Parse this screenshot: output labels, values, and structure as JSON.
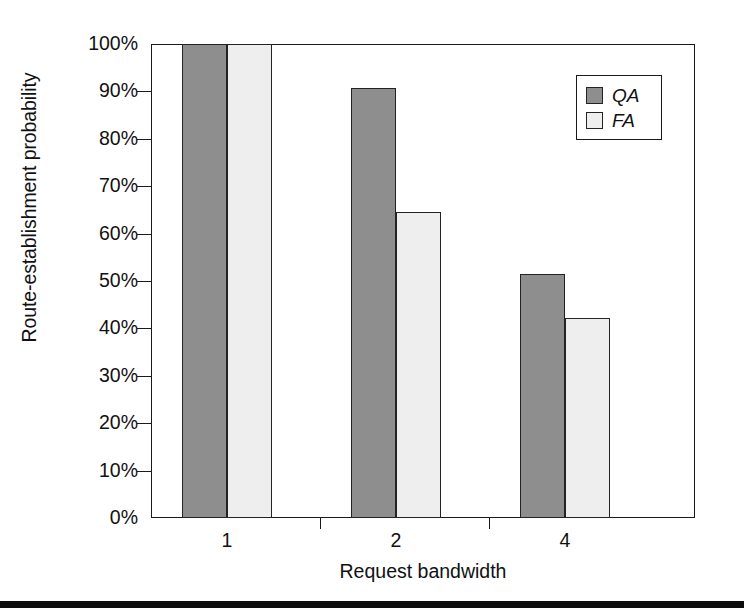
{
  "chart_data": {
    "type": "bar",
    "title": "",
    "xlabel": "Request bandwidth",
    "ylabel": "Route-establishment probability",
    "categories": [
      "1",
      "2",
      "4"
    ],
    "ylim": [
      0,
      100
    ],
    "yticks": [
      "0%",
      "10%",
      "20%",
      "30%",
      "40%",
      "50%",
      "60%",
      "70%",
      "80%",
      "90%",
      "100%"
    ],
    "ytick_values": [
      0,
      10,
      20,
      30,
      40,
      50,
      60,
      70,
      80,
      90,
      100
    ],
    "grid": false,
    "legend_position": "top-right",
    "series": [
      {
        "name": "QA",
        "color": "#8e8e8e",
        "values": [
          100,
          90.8,
          51.5
        ]
      },
      {
        "name": "FA",
        "color": "#eeeeee",
        "values": [
          100,
          64.5,
          42.3
        ]
      }
    ]
  },
  "legend": {
    "entries": [
      {
        "label": "QA",
        "swatch": "dark-gray-swatch"
      },
      {
        "label": "FA",
        "swatch": "light-gray-swatch"
      }
    ]
  },
  "axes": {
    "y_title": "Route-establishment probability",
    "x_title": "Request bandwidth",
    "y_ticks": [
      "100%",
      "90%",
      "80%",
      "70%",
      "60%",
      "50%",
      "40%",
      "30%",
      "20%",
      "10%",
      "0%"
    ],
    "x_ticks": [
      "1",
      "2",
      "4"
    ]
  },
  "colors": {
    "qa_fill": "#8e8e8e",
    "fa_fill": "#eeeeee",
    "axis": "#1a1a1a",
    "background": "#ffffff"
  }
}
